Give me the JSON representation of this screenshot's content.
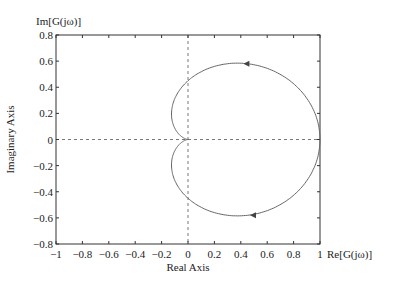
{
  "chart_data": {
    "type": "line",
    "title": "",
    "xlabel": "Real Axis",
    "ylabel": "Imaginary Axis",
    "x_axis_end_label": "Re[G(jω)]",
    "y_axis_top_label": "Im[G(jω)]",
    "xlim": [
      -1,
      1
    ],
    "ylim": [
      -0.8,
      0.8
    ],
    "xticks": [
      "-1",
      "-0.8",
      "-0.6",
      "-0.4",
      "-0.2",
      "0",
      "0.2",
      "0.4",
      "0.6",
      "0.8",
      "1"
    ],
    "yticks": [
      "-0.8",
      "-0.6",
      "-0.4",
      "-0.2",
      "0",
      "0.2",
      "0.4",
      "0.6",
      "0.8"
    ],
    "xtick_values": [
      -1,
      -0.8,
      -0.6,
      -0.4,
      -0.2,
      0,
      0.2,
      0.4,
      0.6,
      0.8,
      1
    ],
    "ytick_values": [
      -0.8,
      -0.6,
      -0.4,
      -0.2,
      0,
      0.2,
      0.4,
      0.6,
      0.8
    ],
    "series": [
      {
        "name": "Nyquist curve",
        "shape": "cardioid",
        "description": "closed curve from (1,0) through (0.45,0.58), cusp at origin, (0.5,-0.58) back to (1,0)"
      }
    ],
    "arrows": [
      {
        "x": 0.45,
        "y": 0.58,
        "direction": "left"
      },
      {
        "x": 0.5,
        "y": -0.58,
        "direction": "left"
      }
    ],
    "grid": false
  }
}
